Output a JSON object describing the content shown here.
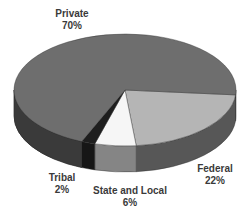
{
  "chart_data": {
    "type": "pie",
    "style": "3d",
    "title": "",
    "slices": [
      {
        "label": "Private",
        "value": 70,
        "display": "70%",
        "top_color": "#6e6e6e",
        "side_color": "#3a3a3a"
      },
      {
        "label": "Federal",
        "value": 22,
        "display": "22%",
        "top_color": "#b5b5b5",
        "side_color": "#575757"
      },
      {
        "label": "State and Local",
        "value": 6,
        "display": "6%",
        "top_color": "#f6f6f6",
        "side_color": "#858585"
      },
      {
        "label": "Tribal",
        "value": 2,
        "display": "2%",
        "top_color": "#1e1e1e",
        "side_color": "#161616"
      }
    ],
    "legend": "none",
    "labels_position": "outside"
  },
  "labels": {
    "private": {
      "name": "Private",
      "pct": "70%"
    },
    "federal": {
      "name": "Federal",
      "pct": "22%"
    },
    "state_local": {
      "name": "State and Local",
      "pct": "6%"
    },
    "tribal": {
      "name": "Tribal",
      "pct": "2%"
    }
  }
}
